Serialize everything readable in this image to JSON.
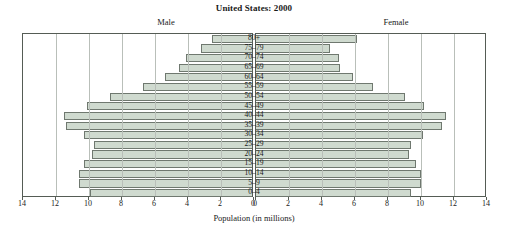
{
  "chart_data": {
    "type": "bar",
    "subtype": "population-pyramid",
    "title": "United States: 2000",
    "xlabel": "Population (in millions)",
    "ylabel": "",
    "categories": [
      "0–4",
      "5–9",
      "10–14",
      "15–19",
      "20–24",
      "25–29",
      "30–34",
      "35–39",
      "40–44",
      "45–49",
      "50–54",
      "55–59",
      "60–64",
      "65–69",
      "70–74",
      "75–79",
      "80+"
    ],
    "series": [
      {
        "name": "Male",
        "values": [
          9.8,
          10.5,
          10.5,
          10.2,
          9.7,
          9.6,
          10.2,
          11.3,
          11.4,
          10.0,
          8.6,
          6.6,
          5.3,
          4.4,
          4.0,
          3.1,
          2.4
        ]
      },
      {
        "name": "Female",
        "values": [
          9.4,
          10.0,
          10.0,
          9.7,
          9.3,
          9.4,
          10.1,
          11.3,
          11.5,
          10.2,
          9.0,
          7.1,
          5.9,
          5.1,
          5.0,
          4.5,
          6.1
        ]
      }
    ],
    "xlim": [
      0,
      14
    ],
    "xticks": [
      0,
      2,
      4,
      6,
      8,
      10,
      12,
      14
    ],
    "grid": true,
    "legend_position": "top",
    "colors": {
      "bar_fill": "#cfdacf",
      "bar_border": "#6f786f",
      "gridline": "#b9bfb9",
      "frame": "#555c55"
    }
  },
  "header": {
    "title": "United States: 2000",
    "male_label": "Male",
    "female_label": "Female"
  },
  "axis": {
    "caption": "Population (in millions)",
    "left_ticks": [
      "14",
      "12",
      "10",
      "8",
      "6",
      "4",
      "2",
      "0"
    ],
    "right_ticks": [
      "0",
      "2",
      "4",
      "6",
      "8",
      "10",
      "12",
      "14"
    ]
  }
}
